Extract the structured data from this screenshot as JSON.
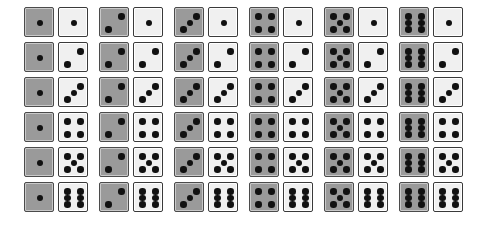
{
  "figure": {
    "rows": 6,
    "columns": 6,
    "total_cells": 36
  },
  "colors": {
    "background": "#ffffff",
    "gray_die_face": "#9a9a9a",
    "gray_die_border": "#4b4b4b",
    "gray_die_highlight": "#c9c9c9",
    "white_die_face": "#f0f0f0",
    "white_die_border": "#3a3a3a",
    "white_die_highlight": "#ffffff",
    "pip": "#111111"
  },
  "geometry": {
    "canvas_width": 483,
    "canvas_height": 233,
    "die_size": 30,
    "gap_within_pair": 4,
    "column_pitch": 75,
    "row_pitch": 35,
    "origin_x": 24,
    "origin_y": 7
  },
  "dice": {
    "gray_values": [
      1,
      2,
      3,
      4,
      5,
      6
    ],
    "white_values": [
      1,
      2,
      3,
      4,
      5,
      6
    ],
    "pip_layouts": {
      "1": [
        "center"
      ],
      "2": [
        "bottom-left",
        "top-right"
      ],
      "3": [
        "bottom-left",
        "center",
        "top-right"
      ],
      "4": [
        "top-left",
        "top-right",
        "bottom-left",
        "bottom-right"
      ],
      "5": [
        "top-left",
        "top-right",
        "center",
        "bottom-left",
        "bottom-right"
      ],
      "6": [
        "top-left",
        "top-right",
        "mid-left",
        "mid-right",
        "bottom-left",
        "bottom-right"
      ]
    }
  },
  "chart_data": {
    "type": "table",
    "xlabel": "Gray die value",
    "ylabel": "White die value",
    "categories": [
      "1",
      "2",
      "3",
      "4",
      "5",
      "6"
    ],
    "cells": [
      [
        [
          1,
          1
        ],
        [
          2,
          1
        ],
        [
          3,
          1
        ],
        [
          4,
          1
        ],
        [
          5,
          1
        ],
        [
          6,
          1
        ]
      ],
      [
        [
          1,
          2
        ],
        [
          2,
          2
        ],
        [
          3,
          2
        ],
        [
          4,
          2
        ],
        [
          5,
          2
        ],
        [
          6,
          2
        ]
      ],
      [
        [
          1,
          3
        ],
        [
          2,
          3
        ],
        [
          3,
          3
        ],
        [
          4,
          3
        ],
        [
          5,
          3
        ],
        [
          6,
          3
        ]
      ],
      [
        [
          1,
          4
        ],
        [
          2,
          4
        ],
        [
          3,
          4
        ],
        [
          4,
          4
        ],
        [
          5,
          4
        ],
        [
          6,
          4
        ]
      ],
      [
        [
          1,
          5
        ],
        [
          2,
          5
        ],
        [
          3,
          5
        ],
        [
          4,
          5
        ],
        [
          5,
          5
        ],
        [
          6,
          5
        ]
      ],
      [
        [
          1,
          6
        ],
        [
          2,
          6
        ],
        [
          3,
          6
        ],
        [
          4,
          6
        ],
        [
          5,
          6
        ],
        [
          6,
          6
        ]
      ]
    ]
  }
}
